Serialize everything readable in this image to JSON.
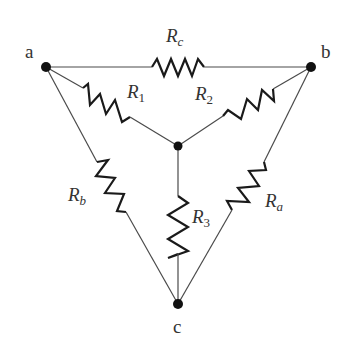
{
  "diagram": {
    "type": "circuit",
    "nodes": {
      "a": {
        "label": "a"
      },
      "b": {
        "label": "b"
      },
      "c": {
        "label": "c"
      },
      "center": {
        "label": ""
      }
    },
    "resistors": {
      "Rc": {
        "base": "R",
        "sub": "c",
        "between": [
          "a",
          "b"
        ]
      },
      "R1": {
        "base": "R",
        "sub": "1",
        "between": [
          "a",
          "center"
        ]
      },
      "R2": {
        "base": "R",
        "sub": "2",
        "between": [
          "b",
          "center"
        ]
      },
      "R3": {
        "base": "R",
        "sub": "3",
        "between": [
          "center",
          "c"
        ]
      },
      "Rb": {
        "base": "R",
        "sub": "b",
        "between": [
          "a",
          "c"
        ]
      },
      "Ra": {
        "base": "R",
        "sub": "a",
        "between": [
          "b",
          "c"
        ]
      }
    },
    "colors": {
      "wire": "#4a4a4a",
      "resistor": "#1a1a1a",
      "node": "#111111",
      "label": "#333333"
    }
  }
}
